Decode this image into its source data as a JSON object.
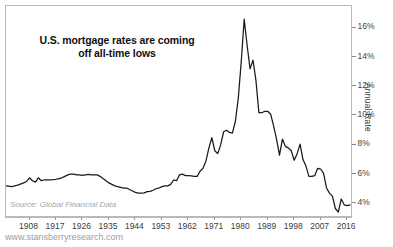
{
  "chart_data": {
    "type": "line",
    "title": "U.S. mortgage rates are coming\noff all-time lows",
    "xlabel": "",
    "ylabel": "Annual Rate",
    "source": "Source: Global Financial Data",
    "footer": "www.stansberryresearch.com",
    "line_color": "#1a1a1a",
    "frame_color": "#b9b9b9",
    "grid": false,
    "legend": "none",
    "xlim": [
      1900,
      2018
    ],
    "ylim": [
      3.0,
      17.5
    ],
    "x_ticks": [
      1908,
      1917,
      1926,
      1935,
      1944,
      1953,
      1962,
      1971,
      1980,
      1989,
      1998,
      2007,
      2016
    ],
    "x_tick_labels": [
      "1908",
      "1917",
      "1926",
      "1935",
      "1944",
      "1953",
      "1962",
      "1971",
      "1980",
      "1989",
      "1998",
      "2007",
      "2016"
    ],
    "y_ticks": [
      4,
      6,
      8,
      10,
      12,
      14,
      16
    ],
    "y_tick_labels": [
      "4%",
      "6%",
      "8%",
      "10%",
      "12%",
      "14%",
      "16%"
    ],
    "series": [
      {
        "name": "U.S. mortgage rate",
        "x": [
          1900,
          1902,
          1904,
          1906,
          1907,
          1908,
          1909,
          1910,
          1911,
          1912,
          1913,
          1914,
          1915,
          1916,
          1917,
          1918,
          1919,
          1920,
          1921,
          1922,
          1923,
          1924,
          1925,
          1926,
          1927,
          1928,
          1929,
          1930,
          1931,
          1932,
          1933,
          1934,
          1935,
          1936,
          1937,
          1938,
          1939,
          1940,
          1941,
          1942,
          1943,
          1944,
          1945,
          1946,
          1947,
          1948,
          1949,
          1950,
          1951,
          1952,
          1953,
          1954,
          1955,
          1956,
          1957,
          1958,
          1959,
          1960,
          1961,
          1962,
          1963,
          1964,
          1965,
          1966,
          1967,
          1968,
          1969,
          1970,
          1971,
          1972,
          1973,
          1974,
          1975,
          1976,
          1977,
          1978,
          1979,
          1980,
          1981,
          1982,
          1983,
          1984,
          1985,
          1986,
          1987,
          1988,
          1989,
          1990,
          1991,
          1992,
          1993,
          1994,
          1995,
          1996,
          1997,
          1998,
          1999,
          2000,
          2001,
          2002,
          2003,
          2004,
          2005,
          2006,
          2007,
          2008,
          2009,
          2010,
          2011,
          2012,
          2013,
          2014,
          2015,
          2016,
          2017
        ],
        "y": [
          5.2,
          5.15,
          5.25,
          5.4,
          5.5,
          5.75,
          5.55,
          5.45,
          5.75,
          5.55,
          5.6,
          5.6,
          5.6,
          5.62,
          5.65,
          5.7,
          5.75,
          5.85,
          5.95,
          6.0,
          6.0,
          5.95,
          5.95,
          5.92,
          5.95,
          5.98,
          5.95,
          5.95,
          5.95,
          5.85,
          5.7,
          5.55,
          5.4,
          5.3,
          5.2,
          5.15,
          5.1,
          5.05,
          5.05,
          4.95,
          4.85,
          4.75,
          4.7,
          4.7,
          4.72,
          4.8,
          4.82,
          4.9,
          5.0,
          5.05,
          5.15,
          5.2,
          5.2,
          5.3,
          5.6,
          5.55,
          5.95,
          6.0,
          5.9,
          5.9,
          5.88,
          5.85,
          5.85,
          6.2,
          6.4,
          6.9,
          7.8,
          8.5,
          7.6,
          7.4,
          8.0,
          8.9,
          9.0,
          8.85,
          8.8,
          9.6,
          11.2,
          13.7,
          16.6,
          14.8,
          13.2,
          13.8,
          12.4,
          10.2,
          10.2,
          10.3,
          10.3,
          10.1,
          9.3,
          8.4,
          7.3,
          8.4,
          7.9,
          7.8,
          7.6,
          6.95,
          7.4,
          8.05,
          7.0,
          6.55,
          5.85,
          5.85,
          5.9,
          6.4,
          6.35,
          6.05,
          5.05,
          4.7,
          4.5,
          3.65,
          3.4,
          4.3,
          3.9,
          3.85,
          3.9
        ]
      }
    ]
  }
}
